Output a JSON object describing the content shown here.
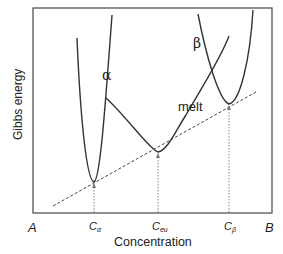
{
  "diagram": {
    "ylabel": "Gibbs energy",
    "xlabel": "Concentration",
    "x_end_left": "A",
    "x_end_right": "B",
    "ticks": [
      {
        "base": "C",
        "sub": "α"
      },
      {
        "base": "C",
        "sub": "eu"
      },
      {
        "base": "C",
        "sub": "β"
      }
    ],
    "curves": [
      {
        "name": "alpha",
        "label": "α"
      },
      {
        "name": "melt",
        "label": "melt"
      },
      {
        "name": "beta",
        "label": "β"
      }
    ],
    "common_tangent": "dashed line",
    "colors": {
      "line": "#333333",
      "frame": "#555555",
      "dashed": "#444444"
    }
  }
}
